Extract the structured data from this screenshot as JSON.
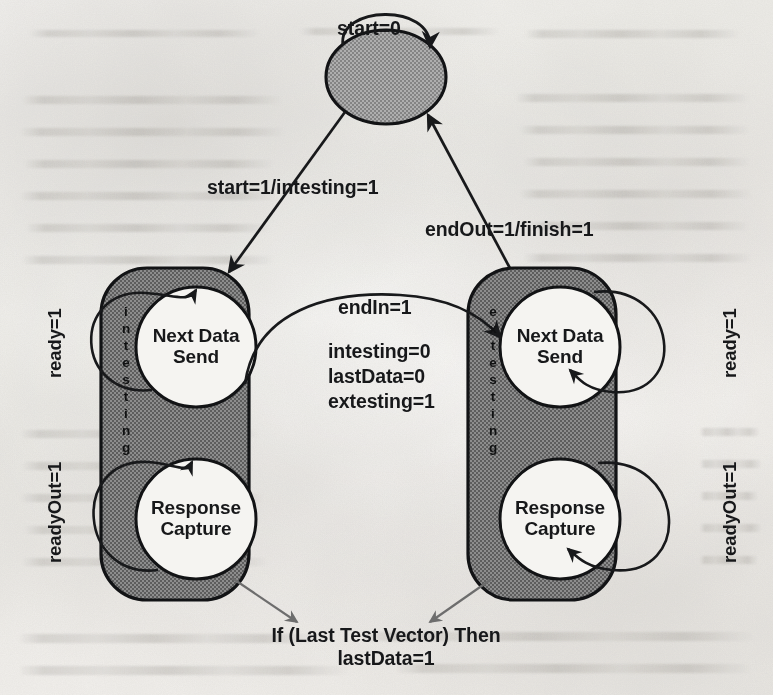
{
  "page": {
    "kind": "scanned-book-page",
    "figure_type": "hierarchical-state-machine-diagram",
    "width": 773,
    "height": 695
  },
  "palette": {
    "paper": "#f1efec",
    "ink": "#17181a",
    "superstate_fill": "#787878",
    "idle_fill": "#9a9a9a",
    "inner_state_fill": "#f2f1ee",
    "annotation_arrow": "#6e6e6e"
  },
  "diagram": {
    "idle_state": {
      "name": "idle-ellipse-state",
      "shape": "ellipse",
      "label": "",
      "self_loop_label": "start=0"
    },
    "superstates": [
      {
        "id": "intesting",
        "vertical_label": "intesting",
        "letters": [
          "i",
          "n",
          "t",
          "e",
          "s",
          "t",
          "i",
          "n",
          "g"
        ],
        "inner_states": [
          {
            "id": "in-next-data-send",
            "label": "Next Data\nSend",
            "line1": "Next Data",
            "line2": "Send",
            "self_loop_label": "ready=1"
          },
          {
            "id": "in-response-capture",
            "label": "Response\nCapture",
            "line1": "Response",
            "line2": "Capture",
            "self_loop_label": "readyOut=1"
          }
        ]
      },
      {
        "id": "extesting",
        "vertical_label": "extesting",
        "letters": [
          "e",
          "x",
          "t",
          "e",
          "s",
          "t",
          "i",
          "n",
          "g"
        ],
        "inner_states": [
          {
            "id": "ex-next-data-send",
            "label": "Next Data\nSend",
            "line1": "Next Data",
            "line2": "Send",
            "self_loop_label": "ready=1"
          },
          {
            "id": "ex-response-capture",
            "label": "Response\nCapture",
            "line1": "Response",
            "line2": "Capture",
            "self_loop_label": "readyOut=1"
          }
        ]
      }
    ],
    "transitions": [
      {
        "id": "idle-self",
        "from": "idle",
        "to": "idle",
        "label": "start=0"
      },
      {
        "id": "idle-to-intest",
        "from": "idle",
        "to": "intesting",
        "label": "start=1/intesting=1"
      },
      {
        "id": "extest-to-idle",
        "from": "extesting",
        "to": "idle",
        "label": "endOut=1/finish=1"
      },
      {
        "id": "intest-to-extest",
        "from": "intesting",
        "to": "extesting",
        "label_lines": [
          "endIn=1",
          "intesting=0",
          "lastData=0",
          "extesting=1"
        ],
        "guard": "endIn=1",
        "actions": [
          "intesting=0",
          "lastData=0",
          "extesting=1"
        ]
      }
    ],
    "annotation": {
      "id": "last-test-vector-note",
      "line1": "If (Last Test Vector) Then",
      "line2": "lastData=1",
      "points_from": [
        "intesting",
        "extesting"
      ]
    }
  }
}
